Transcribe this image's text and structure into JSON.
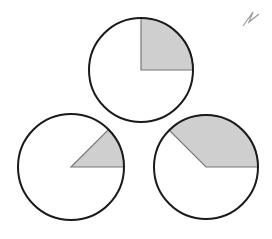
{
  "diagram": {
    "background": "#ffffff",
    "stroke_color": "#1a1a1a",
    "shade_color": "#cfcfcf",
    "circles": [
      {
        "id": "top",
        "cx": 141,
        "cy": 70,
        "r": 52,
        "wedge_start_deg": 0,
        "wedge_end_deg": 90
      },
      {
        "id": "bottom-left",
        "cx": 71,
        "cy": 167,
        "r": 53,
        "wedge_start_deg": 0,
        "wedge_end_deg": 45
      },
      {
        "id": "bottom-right",
        "cx": 206,
        "cy": 167,
        "r": 52,
        "wedge_start_deg": 0,
        "wedge_end_deg": 135
      }
    ],
    "pencil_mark": {
      "points": "243,26 253,12 249,22 259,14"
    }
  }
}
